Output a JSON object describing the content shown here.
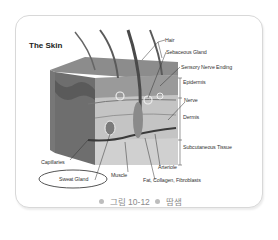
{
  "diagram": {
    "title": "The Skin",
    "labels": {
      "hair": "Hair",
      "sebaceous_gland": "Sebaceous Gland",
      "sensory_nerve_ending": "Sensory Nerve Ending",
      "epidermis": "Epidermis",
      "nerve": "Nerve",
      "dermis": "Dermis",
      "subcutaneous_tissue": "Subcutaneous Tissue",
      "arteriole": "Arteriole",
      "fat": "Fat, Collagen, Fibroblasts",
      "muscle": "Muscle",
      "capillaries": "Capillaries",
      "sweat_gland": "Sweat Gland"
    },
    "highlighted_label": "Sweat Gland",
    "highlight_color": "#555555"
  },
  "caption": {
    "figure": "그림 10-12",
    "title": "땀샘"
  }
}
